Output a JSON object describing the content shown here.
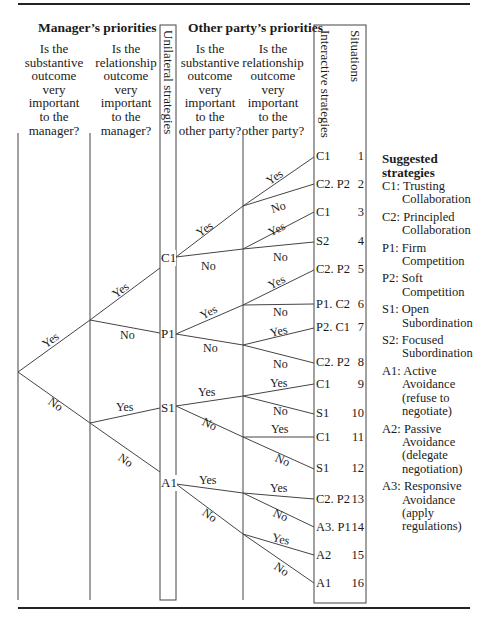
{
  "headers": {
    "manager": "Manager’s priorities",
    "other_party": "Other party’s priorities"
  },
  "questions": [
    "Is the\nsubstantive\noutcome\nvery\nimportant\nto the\nmanager?",
    "Is the\nrelationship\noutcome\nvery\nimportant\nto the\nmanager?",
    "Is the\nsubstantive\noutcome\nvery\nimportant\nto the\nother party?",
    "Is the\nrelationship\noutcome\nvery\nimportant\nto the\nother party?"
  ],
  "column_labels": {
    "unilateral": "Unilateral strategies",
    "interactive": "Interactive strategies",
    "situations": "Situations"
  },
  "tree": {
    "root_branches": {
      "upper": "Yes",
      "lower": "No"
    },
    "level1": [
      {
        "upper": "Yes",
        "lower": "No"
      },
      {
        "upper": "Yes",
        "lower": "No"
      }
    ],
    "unilateral_nodes": [
      "C1",
      "P1",
      "S1",
      "A1"
    ],
    "unilateral_branches": [
      {
        "upper": "Yes",
        "lower": "No"
      },
      {
        "upper": "Yes",
        "lower": "No"
      },
      {
        "upper": "Yes",
        "lower": "No"
      },
      {
        "upper": "Yes",
        "lower": "No"
      }
    ],
    "level3_branches": [
      {
        "upper": "Yes",
        "lower": "No"
      },
      {
        "upper": "Yes",
        "lower": "No"
      },
      {
        "upper": "Yes",
        "lower": "No"
      },
      {
        "upper": "Yes",
        "lower": "No"
      },
      {
        "upper": "Yes",
        "lower": "No"
      },
      {
        "upper": "Yes",
        "lower": "No"
      },
      {
        "upper": "Yes",
        "lower": "No"
      },
      {
        "upper": "Yes",
        "lower": "No"
      }
    ]
  },
  "situations": [
    {
      "strategy": "C1",
      "number": "1"
    },
    {
      "strategy": "C2. P2",
      "number": "2"
    },
    {
      "strategy": "C1",
      "number": "3"
    },
    {
      "strategy": "S2",
      "number": "4"
    },
    {
      "strategy": "C2. P2",
      "number": "5"
    },
    {
      "strategy": "P1. C2",
      "number": "6"
    },
    {
      "strategy": "P2. C1",
      "number": "7"
    },
    {
      "strategy": "C2. P2",
      "number": "8"
    },
    {
      "strategy": "C1",
      "number": "9"
    },
    {
      "strategy": "S1",
      "number": "10"
    },
    {
      "strategy": "C1",
      "number": "11"
    },
    {
      "strategy": "S1",
      "number": "12"
    },
    {
      "strategy": "C2. P2",
      "number": "13"
    },
    {
      "strategy": "A3. P1",
      "number": "14"
    },
    {
      "strategy": "A2",
      "number": "15"
    },
    {
      "strategy": "A1",
      "number": "16"
    }
  ],
  "legend": {
    "title_line1": "Suggested",
    "title_line2": "strategies",
    "items": [
      {
        "code": "C1:",
        "lines": [
          "Trusting",
          "Collaboration"
        ]
      },
      {
        "code": "C2:",
        "lines": [
          "Principled",
          "Collaboration"
        ]
      },
      {
        "code": "P1:",
        "lines": [
          "Firm",
          "Competition"
        ]
      },
      {
        "code": "P2:",
        "lines": [
          "Soft",
          "Competition"
        ]
      },
      {
        "code": "S1:",
        "lines": [
          "Open",
          "Subordination"
        ]
      },
      {
        "code": "S2:",
        "lines": [
          "Focused",
          "Subordination"
        ]
      },
      {
        "code": "A1:",
        "lines": [
          "Active",
          "Avoidance",
          "(refuse to",
          "negotiate)"
        ]
      },
      {
        "code": "A2:",
        "lines": [
          "Passive",
          "Avoidance",
          "(delegate",
          "negotiation)"
        ]
      },
      {
        "code": "A3:",
        "lines": [
          "Responsive",
          "Avoidance",
          "(apply",
          "regulations)"
        ]
      }
    ]
  },
  "colors": {
    "line": "#444444",
    "text": "#1a1a1a",
    "rule": "#222222"
  }
}
